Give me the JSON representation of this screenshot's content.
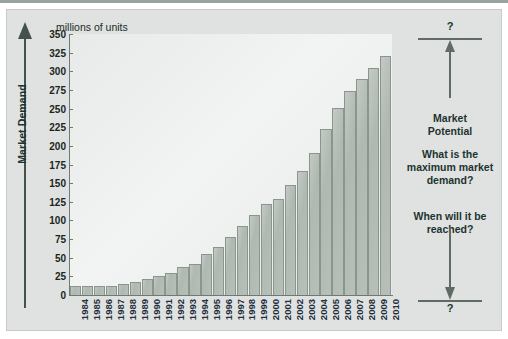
{
  "figure": {
    "units_label": "millions of units",
    "y_axis_title": "Market Demand"
  },
  "annotation": {
    "question_top": "?",
    "question_bottom": "?",
    "label": "Market\nPotential",
    "label_line1": "Market",
    "label_line2": "Potential",
    "question_1": "What is the maximum market demand?",
    "question_2": "When will it be reached?",
    "arrow_up_icon": "arrow-up-icon",
    "arrow_down_icon": "arrow-down-icon"
  },
  "colors": {
    "bar_fill": "#b3bdb5",
    "bar_stroke": "#8c958d",
    "axis": "#6f7a72",
    "panel_bg": "#dfe2e0",
    "plot_bg": "#eef1ef",
    "text_dark": "#1d3330",
    "xlabel": "#1f2d3d"
  },
  "chart_data": {
    "type": "bar",
    "title": "",
    "subtitle": "",
    "xlabel": "",
    "ylabel": "Market Demand",
    "units": "millions of units",
    "ylim": [
      0,
      350
    ],
    "ytick_step": 25,
    "yticks": [
      0,
      25,
      50,
      75,
      100,
      125,
      150,
      175,
      200,
      225,
      250,
      275,
      300,
      325,
      350
    ],
    "grid": false,
    "legend": null,
    "categories": [
      "1984",
      "1985",
      "1986",
      "1987",
      "1988",
      "1989",
      "1990",
      "1991",
      "1992",
      "1993",
      "1994",
      "1995",
      "1996",
      "1997",
      "1998",
      "1999",
      "2000",
      "2001",
      "2002",
      "2003",
      "2004",
      "2005",
      "2006",
      "2007",
      "2008",
      "2009",
      "2010"
    ],
    "values": [
      12,
      12,
      12,
      12,
      15,
      18,
      22,
      25,
      30,
      37,
      42,
      55,
      65,
      78,
      92,
      107,
      122,
      129,
      147,
      166,
      190,
      222,
      251,
      273,
      290,
      305,
      321
    ],
    "annotations": [
      {
        "text": "?",
        "position": "top-right"
      },
      {
        "text": "Market Potential",
        "position": "right"
      },
      {
        "text": "What is the maximum market demand?",
        "position": "right"
      },
      {
        "text": "When will it be reached?",
        "position": "right"
      },
      {
        "text": "?",
        "position": "bottom-right"
      }
    ]
  }
}
